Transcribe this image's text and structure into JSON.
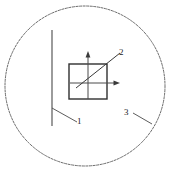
{
  "figure": {
    "kind": "technical-line-drawing",
    "background_color": "#ffffff",
    "line_color": "#3a3a3a",
    "detail_circle_color": "#5a5a5a",
    "width": 172,
    "height": 169
  },
  "detail_circle": {
    "name": "detail-view-boundary",
    "center_x": 85,
    "center_y": 86,
    "radius": 80,
    "stroke": "#5a5a5a",
    "stroke_width": 0.9,
    "dash_pattern": "2.2 1.4"
  },
  "vertical_line": {
    "name": "vertical-edge-line",
    "x": 52,
    "y_top": 30,
    "y_bottom": 126,
    "stroke": "#4a4a4a",
    "stroke_width": 1.1
  },
  "square": {
    "name": "detail-square",
    "x": 69,
    "y": 64,
    "width": 38,
    "height": 35,
    "stroke": "#2f2f2f",
    "stroke_width": 1.4
  },
  "axes": {
    "origin_x": 88,
    "origin_y": 83,
    "stroke": "#4a4a4a",
    "stroke_width": 1.0,
    "vertical_axis": {
      "name": "vertical-axis-arrow",
      "x": 88,
      "y_bottom": 99,
      "y_tip": 51
    },
    "horizontal_axis": {
      "name": "horizontal-axis-arrow",
      "y": 83,
      "x_left": 70,
      "x_tip": 120
    }
  },
  "diagonal_vector": {
    "name": "diagonal-vector-line",
    "x1": 76,
    "y1": 88,
    "x2": 120,
    "y2": 53,
    "stroke": "#3a3a3a",
    "stroke_width": 1.0
  },
  "leaders": [
    {
      "name": "leader-line-1",
      "x1": 52,
      "y1": 108,
      "x2": 77,
      "y2": 122,
      "stroke": "#4a4a4a",
      "stroke_width": 0.9
    },
    {
      "name": "leader-line-2",
      "x1": 112,
      "y1": 61,
      "x2": 120,
      "y2": 53,
      "stroke": "#4a4a4a",
      "stroke_width": 0.9
    },
    {
      "name": "leader-line-3",
      "x1": 133,
      "y1": 113,
      "x2": 152,
      "y2": 124,
      "stroke": "#4a4a4a",
      "stroke_width": 0.9
    }
  ],
  "callouts": {
    "ref_1": "1",
    "ref_2": "2",
    "ref_3": "3"
  }
}
